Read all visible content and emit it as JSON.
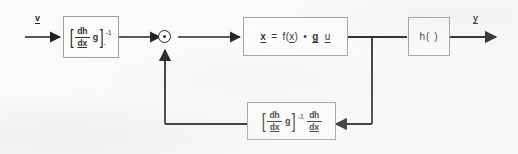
{
  "diagram": {
    "signals": {
      "input": "v",
      "output": "y"
    },
    "blocks": [
      {
        "id": "prefilter",
        "name": "input-gain-block",
        "expression": "[dh/dx g]^-1 .",
        "parts": {
          "bracket_open": "[",
          "frac_num": "dh",
          "frac_den": "dx",
          "g": "g",
          "bracket_close": "]",
          "exponent": "-1",
          "dot": "."
        }
      },
      {
        "id": "plant",
        "name": "plant-dynamics-block",
        "expression": "x = f(x) + g u",
        "parts": {
          "xdot": "x",
          "equals": "=",
          "f": "f(",
          "f_arg": "x",
          "f_close": ")",
          "plus": "•",
          "g": "g",
          "u": "u"
        }
      },
      {
        "id": "output_map",
        "name": "output-map-block",
        "expression": "h( )"
      },
      {
        "id": "feedback",
        "name": "feedback-gain-block",
        "expression": "[dh/dx g]^-1 dh/dx",
        "parts": {
          "bracket_open": "[",
          "frac1_num": "dh",
          "frac1_den": "dx",
          "g": "g",
          "bracket_close": "]",
          "exponent": "-1",
          "frac2_num": "dh",
          "frac2_den": "dx"
        }
      }
    ],
    "junction": {
      "name": "summing-junction",
      "symbol": "⊕"
    },
    "colors": {
      "line": "#141414",
      "block_border": "#9b9b98",
      "paper": "#fbfbfa",
      "text": "#1d1d1d"
    }
  }
}
